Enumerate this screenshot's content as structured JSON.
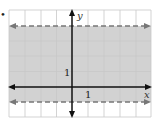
{
  "graph": {
    "bullet": "•",
    "axis_labels": {
      "x": "x",
      "y": "y"
    },
    "tick_labels": {
      "x_unit": "1",
      "y_unit": "1"
    },
    "grid": {
      "x_min": -4,
      "x_max": 5,
      "y_min": -2,
      "y_max": 5
    },
    "region": {
      "description": "Shaded band between two dashed horizontal lines",
      "lower_boundary": "y = -1 (dashed)",
      "upper_boundary": "y = 4 (dashed)",
      "inequality": "-1 < y < 4"
    },
    "colors": {
      "shade": "#d2d2d2",
      "grid": "#c4c4c4",
      "axis": "#111111",
      "dashed": "#777777"
    }
  }
}
